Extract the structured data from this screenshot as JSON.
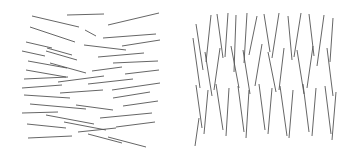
{
  "figure": {
    "width": 349,
    "height": 158,
    "background_color": "#ffffff",
    "stroke_color": "#555555",
    "stroke_width": 0.9
  },
  "panels": [
    {
      "id": "left-panel",
      "name": "horizontal-line-field",
      "orientation": "horizontal",
      "bounds": {
        "x": 22,
        "y": 12,
        "width": 138,
        "height": 135
      },
      "segment_count": 35,
      "segments": [
        {
          "x1": 32,
          "y1": 16,
          "x2": 79,
          "y2": 27
        },
        {
          "x1": 67,
          "y1": 15,
          "x2": 104,
          "y2": 14
        },
        {
          "x1": 108,
          "y1": 25,
          "x2": 159,
          "y2": 13
        },
        {
          "x1": 30,
          "y1": 27,
          "x2": 75,
          "y2": 42
        },
        {
          "x1": 85,
          "y1": 30,
          "x2": 96,
          "y2": 36
        },
        {
          "x1": 103,
          "y1": 38,
          "x2": 156,
          "y2": 34
        },
        {
          "x1": 26,
          "y1": 42,
          "x2": 52,
          "y2": 48
        },
        {
          "x1": 122,
          "y1": 46,
          "x2": 160,
          "y2": 40
        },
        {
          "x1": 47,
          "y1": 48,
          "x2": 72,
          "y2": 55
        },
        {
          "x1": 84,
          "y1": 45,
          "x2": 126,
          "y2": 50
        },
        {
          "x1": 46,
          "y1": 51,
          "x2": 77,
          "y2": 60
        },
        {
          "x1": 22,
          "y1": 51,
          "x2": 45,
          "y2": 56
        },
        {
          "x1": 98,
          "y1": 57,
          "x2": 144,
          "y2": 53
        },
        {
          "x1": 28,
          "y1": 61,
          "x2": 67,
          "y2": 68
        },
        {
          "x1": 50,
          "y1": 63,
          "x2": 86,
          "y2": 73
        },
        {
          "x1": 113,
          "y1": 63,
          "x2": 158,
          "y2": 61
        },
        {
          "x1": 26,
          "y1": 70,
          "x2": 66,
          "y2": 77
        },
        {
          "x1": 92,
          "y1": 71,
          "x2": 122,
          "y2": 67
        },
        {
          "x1": 125,
          "y1": 74,
          "x2": 159,
          "y2": 70
        },
        {
          "x1": 24,
          "y1": 79,
          "x2": 68,
          "y2": 77
        },
        {
          "x1": 58,
          "y1": 82,
          "x2": 104,
          "y2": 76
        },
        {
          "x1": 88,
          "y1": 84,
          "x2": 133,
          "y2": 79
        },
        {
          "x1": 22,
          "y1": 88,
          "x2": 62,
          "y2": 85
        },
        {
          "x1": 112,
          "y1": 90,
          "x2": 160,
          "y2": 83
        },
        {
          "x1": 24,
          "y1": 95,
          "x2": 70,
          "y2": 98
        },
        {
          "x1": 60,
          "y1": 93,
          "x2": 103,
          "y2": 90
        },
        {
          "x1": 113,
          "y1": 98,
          "x2": 150,
          "y2": 92
        },
        {
          "x1": 30,
          "y1": 104,
          "x2": 86,
          "y2": 109
        },
        {
          "x1": 76,
          "y1": 105,
          "x2": 113,
          "y2": 110
        },
        {
          "x1": 123,
          "y1": 106,
          "x2": 158,
          "y2": 101
        },
        {
          "x1": 22,
          "y1": 113,
          "x2": 58,
          "y2": 112
        },
        {
          "x1": 46,
          "y1": 115,
          "x2": 94,
          "y2": 124
        },
        {
          "x1": 100,
          "y1": 118,
          "x2": 152,
          "y2": 113
        },
        {
          "x1": 27,
          "y1": 124,
          "x2": 66,
          "y2": 128
        },
        {
          "x1": 64,
          "y1": 122,
          "x2": 106,
          "y2": 130
        },
        {
          "x1": 116,
          "y1": 127,
          "x2": 155,
          "y2": 122
        },
        {
          "x1": 78,
          "y1": 132,
          "x2": 116,
          "y2": 128
        },
        {
          "x1": 28,
          "y1": 138,
          "x2": 72,
          "y2": 136
        },
        {
          "x1": 88,
          "y1": 134,
          "x2": 122,
          "y2": 143
        },
        {
          "x1": 108,
          "y1": 137,
          "x2": 146,
          "y2": 147
        }
      ]
    },
    {
      "id": "right-panel",
      "name": "vertical-line-field",
      "orientation": "vertical",
      "bounds": {
        "x": 192,
        "y": 12,
        "width": 146,
        "height": 135
      },
      "segment_count": 40,
      "segments": [
        {
          "x1": 196,
          "y1": 24,
          "x2": 203,
          "y2": 70
        },
        {
          "x1": 211,
          "y1": 15,
          "x2": 206,
          "y2": 62
        },
        {
          "x1": 217,
          "y1": 14,
          "x2": 223,
          "y2": 58
        },
        {
          "x1": 228,
          "y1": 13,
          "x2": 225,
          "y2": 57
        },
        {
          "x1": 236,
          "y1": 15,
          "x2": 234,
          "y2": 72
        },
        {
          "x1": 247,
          "y1": 13,
          "x2": 244,
          "y2": 63
        },
        {
          "x1": 257,
          "y1": 16,
          "x2": 249,
          "y2": 55
        },
        {
          "x1": 264,
          "y1": 14,
          "x2": 270,
          "y2": 52
        },
        {
          "x1": 279,
          "y1": 13,
          "x2": 272,
          "y2": 58
        },
        {
          "x1": 288,
          "y1": 16,
          "x2": 292,
          "y2": 60
        },
        {
          "x1": 301,
          "y1": 13,
          "x2": 294,
          "y2": 57
        },
        {
          "x1": 309,
          "y1": 14,
          "x2": 314,
          "y2": 56
        },
        {
          "x1": 324,
          "y1": 15,
          "x2": 317,
          "y2": 66
        },
        {
          "x1": 333,
          "y1": 18,
          "x2": 330,
          "y2": 62
        },
        {
          "x1": 193,
          "y1": 38,
          "x2": 200,
          "y2": 88
        },
        {
          "x1": 205,
          "y1": 52,
          "x2": 212,
          "y2": 96
        },
        {
          "x1": 220,
          "y1": 48,
          "x2": 214,
          "y2": 90
        },
        {
          "x1": 231,
          "y1": 46,
          "x2": 239,
          "y2": 88
        },
        {
          "x1": 243,
          "y1": 50,
          "x2": 250,
          "y2": 94
        },
        {
          "x1": 262,
          "y1": 44,
          "x2": 255,
          "y2": 86
        },
        {
          "x1": 268,
          "y1": 52,
          "x2": 276,
          "y2": 92
        },
        {
          "x1": 284,
          "y1": 48,
          "x2": 279,
          "y2": 90
        },
        {
          "x1": 297,
          "y1": 50,
          "x2": 304,
          "y2": 94
        },
        {
          "x1": 313,
          "y1": 46,
          "x2": 307,
          "y2": 88
        },
        {
          "x1": 327,
          "y1": 48,
          "x2": 333,
          "y2": 96
        },
        {
          "x1": 196,
          "y1": 85,
          "x2": 202,
          "y2": 128
        },
        {
          "x1": 208,
          "y1": 90,
          "x2": 204,
          "y2": 134
        },
        {
          "x1": 216,
          "y1": 84,
          "x2": 223,
          "y2": 130
        },
        {
          "x1": 229,
          "y1": 88,
          "x2": 226,
          "y2": 136
        },
        {
          "x1": 238,
          "y1": 86,
          "x2": 244,
          "y2": 132
        },
        {
          "x1": 249,
          "y1": 90,
          "x2": 246,
          "y2": 138
        },
        {
          "x1": 259,
          "y1": 84,
          "x2": 265,
          "y2": 130
        },
        {
          "x1": 272,
          "y1": 88,
          "x2": 268,
          "y2": 134
        },
        {
          "x1": 280,
          "y1": 86,
          "x2": 287,
          "y2": 136
        },
        {
          "x1": 293,
          "y1": 90,
          "x2": 289,
          "y2": 138
        },
        {
          "x1": 303,
          "y1": 84,
          "x2": 309,
          "y2": 132
        },
        {
          "x1": 316,
          "y1": 88,
          "x2": 312,
          "y2": 136
        },
        {
          "x1": 325,
          "y1": 86,
          "x2": 331,
          "y2": 134
        },
        {
          "x1": 336,
          "y1": 92,
          "x2": 332,
          "y2": 140
        },
        {
          "x1": 199,
          "y1": 118,
          "x2": 195,
          "y2": 146
        }
      ]
    }
  ]
}
